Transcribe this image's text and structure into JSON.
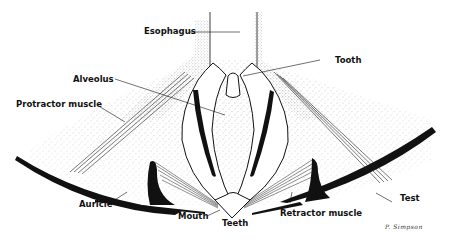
{
  "diagram": {
    "labels": {
      "esophagus": "Esophagus",
      "tooth": "Tooth",
      "alveolus": "Alveolus",
      "protractor_muscle": "Protractor muscle",
      "auricle": "Auricle",
      "mouth": "Mouth",
      "teeth": "Teeth",
      "retractor_muscle": "Retractor muscle",
      "test": "Test"
    },
    "signature": "P. Simpson",
    "colors": {
      "ink": "#111111",
      "stipple": "#555555",
      "background": "#ffffff"
    }
  }
}
